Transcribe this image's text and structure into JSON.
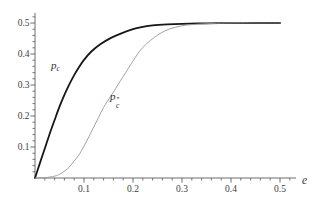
{
  "figure": {
    "background": "#ffffff",
    "axis_color": "#4a4a4a",
    "tick_text_color": "#3d3d3d"
  },
  "labels": {
    "x_axis": "e",
    "curve1": {
      "base": "p",
      "sub": "c"
    },
    "curve2": {
      "base": "p",
      "sup": "″",
      "sub": "c"
    }
  },
  "chart_data": {
    "type": "line",
    "title": "",
    "xlabel": "e",
    "ylabel": "",
    "xlim": [
      0,
      0.5
    ],
    "ylim": [
      0,
      0.5
    ],
    "x_ticks": [
      0.1,
      0.2,
      0.3,
      0.4,
      0.5
    ],
    "y_ticks": [
      0.1,
      0.2,
      0.3,
      0.4,
      0.5
    ],
    "minor_tick_step": 0.02,
    "grid": false,
    "legend": "inline-curve-labels",
    "series": [
      {
        "name": "p_c",
        "label": "pc",
        "color": "#161616",
        "width": 1.8,
        "points": [
          [
            0,
            0
          ],
          [
            0.01,
            0.048
          ],
          [
            0.02,
            0.095
          ],
          [
            0.03,
            0.143
          ],
          [
            0.04,
            0.187
          ],
          [
            0.05,
            0.23
          ],
          [
            0.06,
            0.268
          ],
          [
            0.07,
            0.302
          ],
          [
            0.08,
            0.332
          ],
          [
            0.09,
            0.358
          ],
          [
            0.1,
            0.381
          ],
          [
            0.115,
            0.408
          ],
          [
            0.134,
            0.432
          ],
          [
            0.155,
            0.452
          ],
          [
            0.175,
            0.466
          ],
          [
            0.2,
            0.48
          ],
          [
            0.215,
            0.486
          ],
          [
            0.24,
            0.492
          ],
          [
            0.27,
            0.4955
          ],
          [
            0.3,
            0.4975
          ],
          [
            0.35,
            0.499
          ],
          [
            0.4,
            0.4995
          ],
          [
            0.45,
            0.5
          ],
          [
            0.5,
            0.5
          ]
        ]
      },
      {
        "name": "p_c_double_prime",
        "label": "p″c",
        "color": "#989898",
        "width": 0.9,
        "points": [
          [
            0,
            0
          ],
          [
            0.02,
            0.001
          ],
          [
            0.04,
            0.006
          ],
          [
            0.05,
            0.012
          ],
          [
            0.06,
            0.022
          ],
          [
            0.07,
            0.035
          ],
          [
            0.08,
            0.055
          ],
          [
            0.09,
            0.075
          ],
          [
            0.1,
            0.103
          ],
          [
            0.11,
            0.133
          ],
          [
            0.12,
            0.165
          ],
          [
            0.13,
            0.196
          ],
          [
            0.14,
            0.228
          ],
          [
            0.155,
            0.265
          ],
          [
            0.175,
            0.315
          ],
          [
            0.195,
            0.365
          ],
          [
            0.215,
            0.412
          ],
          [
            0.235,
            0.443
          ],
          [
            0.255,
            0.466
          ],
          [
            0.275,
            0.481
          ],
          [
            0.3,
            0.491
          ],
          [
            0.33,
            0.496
          ],
          [
            0.37,
            0.499
          ],
          [
            0.42,
            0.5
          ],
          [
            0.5,
            0.5
          ]
        ]
      }
    ]
  }
}
